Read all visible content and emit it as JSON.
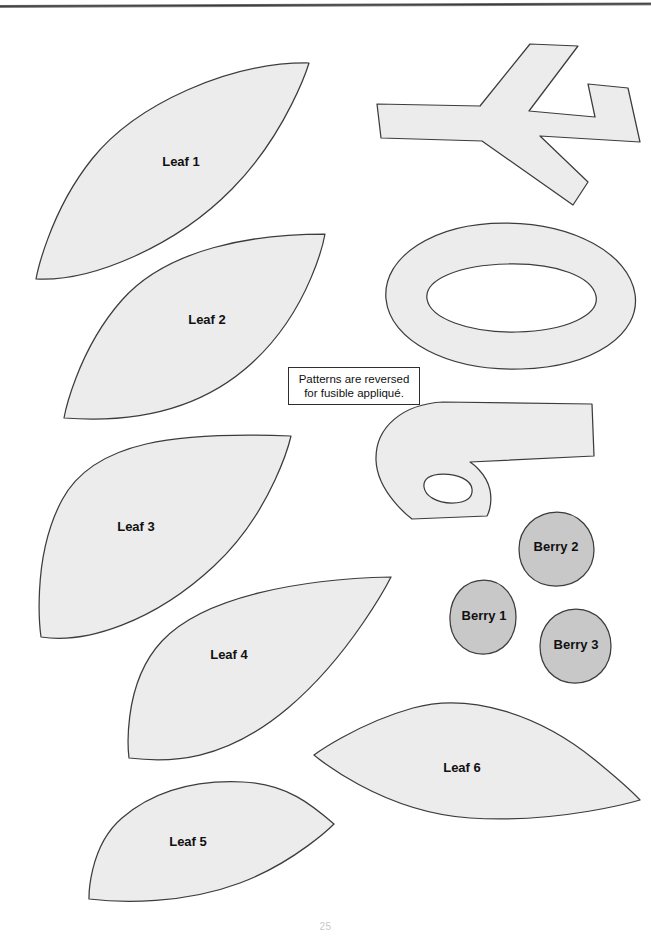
{
  "page": {
    "background_color": "#ffffff",
    "width": 651,
    "height": 938,
    "page_number": "25"
  },
  "colors": {
    "leaf_fill": "#ececec",
    "berry_fill": "#c8c8c8",
    "stem_fill": "#ececec",
    "outline": "#3c3c3c",
    "label_text": "#111111",
    "note_border": "#2e2e2e",
    "top_rule": "#3a3a3a"
  },
  "note": {
    "name": "reversed-pattern-note",
    "line1": "Patterns are reversed",
    "line2": "for fusible appliqué."
  },
  "pieces": [
    {
      "id": "leaf-1",
      "label": "Leaf 1",
      "kind": "leaf",
      "fill": "#ececec",
      "label_x": 181,
      "label_y": 163,
      "path": "M 36 279 C 36 279 48 214 92 159 C 136 104 230 62 309 63 C 309 63 288 132 232 189 C 176 246 92 282 36 279 Z"
    },
    {
      "id": "leaf-2",
      "label": "Leaf 2",
      "kind": "leaf",
      "fill": "#ececec",
      "label_x": 207,
      "label_y": 321,
      "path": "M 64 418 C 64 418 76 352 122 300 C 168 248 254 234 325 234 C 325 234 312 308 252 363 C 192 418 116 422 64 418 Z"
    },
    {
      "id": "leaf-3",
      "label": "Leaf 3",
      "kind": "leaf",
      "fill": "#ececec",
      "label_x": 136,
      "label_y": 528,
      "path": "M 41 637 C 41 637 30 560 62 500 C 94 440 178 432 291 436 C 291 436 274 510 214 566 C 154 622 86 644 41 637 Z"
    },
    {
      "id": "leaf-4",
      "label": "Leaf 4",
      "kind": "leaf",
      "fill": "#ececec",
      "label_x": 229,
      "label_y": 656,
      "path": "M 129 758 C 129 758 120 686 162 641 C 204 596 302 579 391 577 C 391 577 352 654 288 708 C 224 762 170 763 129 758 Z"
    },
    {
      "id": "leaf-5",
      "label": "Leaf 5",
      "kind": "leaf",
      "fill": "#ececec",
      "label_x": 188,
      "label_y": 843,
      "path": "M 89 899 C 89 899 88 847 122 818 C 156 789 200 780 243 782 C 287 784 312 805 334 824 C 334 824 296 862 240 883 C 184 904 122 903 89 899 Z"
    },
    {
      "id": "leaf-6",
      "label": "Leaf 6",
      "kind": "leaf",
      "fill": "#ececec",
      "label_x": 462,
      "label_y": 769,
      "path": "M 314 755 C 314 755 356 724 413 708 C 470 692 540 715 595 760 C 628 787 640 800 640 800 C 640 800 560 824 470 818 C 380 812 314 755 314 755 Z"
    },
    {
      "id": "stem-branch",
      "label": "",
      "kind": "stem",
      "fill": "#ececec",
      "label_x": 0,
      "label_y": 0,
      "path": "M 377 104 L 480 106 L 530 44 L 578 46 L 529 111 L 595 117 L 588 84 L 628 88 L 640 142 L 540 136 L 588 182 L 573 205 L 482 141 L 381 138 Z"
    },
    {
      "id": "stem-ring",
      "label": "",
      "kind": "stem",
      "fill": "#ececec",
      "label_x": 0,
      "label_y": 0,
      "path": "M 504 223 C 574 223 629 254 635 294 C 641 334 594 367 521 369 C 448 371 390 341 386 299 C 382 257 434 223 504 223 Z M 508 264 C 558 263 592 277 596 296 C 600 315 566 331 517 332 C 468 333 430 318 427 299 C 424 280 458 265 508 264 Z"
    },
    {
      "id": "stem-hook",
      "label": "",
      "kind": "stem",
      "fill": "#ececec",
      "label_x": 0,
      "label_y": 0,
      "path": "M 592 404 L 594 456 L 470 462 C 470 462 486 472 490 490 C 493 506 487 516 487 516 L 412 519 C 412 519 377 493 376 460 C 375 427 403 404 443 402 Z M 443 474 C 430 474 423 479 424 487 C 425 496 437 503 452 503 C 467 503 473 497 472 489 C 471 480 458 474 443 474 Z"
    },
    {
      "id": "berry-1",
      "label": "Berry 1",
      "kind": "berry",
      "fill": "#c8c8c8",
      "label_x": 484,
      "label_y": 617,
      "path": "M 484 580 C 504 580 516 598 516 617 C 516 637 504 654 483 654 C 462 654 449 637 450 616 C 451 596 464 580 484 580 Z"
    },
    {
      "id": "berry-2",
      "label": "Berry 2",
      "kind": "berry",
      "fill": "#c8c8c8",
      "label_x": 556,
      "label_y": 548,
      "path": "M 557 512 C 579 512 594 530 594 550 C 594 570 579 586 556 586 C 533 586 519 570 519 549 C 519 529 535 512 557 512 Z"
    },
    {
      "id": "berry-3",
      "label": "Berry 3",
      "kind": "berry",
      "fill": "#c8c8c8",
      "label_x": 576,
      "label_y": 646,
      "path": "M 576 609 C 597 609 611 626 611 646 C 611 666 597 683 575 683 C 553 683 540 666 540 646 C 540 626 555 609 576 609 Z"
    }
  ]
}
